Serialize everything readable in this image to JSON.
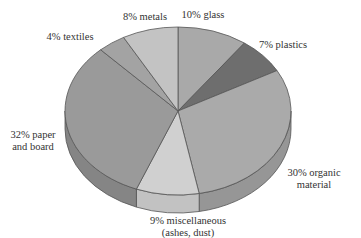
{
  "chart_data": {
    "type": "pie",
    "style": "3d",
    "title": "",
    "start_angle_deg": 0,
    "direction": "clockwise",
    "slices": [
      {
        "name": "glass",
        "value": 10,
        "label_lines": [
          "10% glass"
        ],
        "color": "#a9a9a9",
        "side_color": "#8f8f8f"
      },
      {
        "name": "plastics",
        "value": 7,
        "label_lines": [
          "7% plastics"
        ],
        "color": "#6e6e6e",
        "side_color": "#5a5a5a"
      },
      {
        "name": "organic material",
        "value": 30,
        "label_lines": [
          "30% organic",
          "material"
        ],
        "color": "#aaaaaa",
        "side_color": "#969696"
      },
      {
        "name": "miscellaneous",
        "value": 9,
        "label_lines": [
          "9% miscellaneous",
          "(ashes, dust)"
        ],
        "color": "#d0d0d0",
        "side_color": "#c2c2c2"
      },
      {
        "name": "paper and board",
        "value": 32,
        "label_lines": [
          "32% paper",
          "and board"
        ],
        "color": "#9a9a9a",
        "side_color": "#858585"
      },
      {
        "name": "textiles",
        "value": 4,
        "label_lines": [
          "4% textiles"
        ],
        "color": "#a3a3a3",
        "side_color": "#8c8c8c"
      },
      {
        "name": "metals",
        "value": 8,
        "label_lines": [
          "8% metals"
        ],
        "color": "#c3c3c3",
        "side_color": "#adadad"
      }
    ],
    "outline_color": "#555555",
    "legend": "none"
  }
}
